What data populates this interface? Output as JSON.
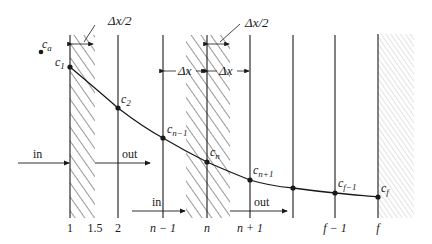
{
  "figure": {
    "colors": {
      "ink": "#1a1a1a",
      "light_hatch": "#b8b8b8"
    },
    "grid_lines": [
      {
        "id": "line-1",
        "label": "1"
      },
      {
        "id": "line-1-5",
        "label": "1.5"
      },
      {
        "id": "line-2",
        "label": "2"
      },
      {
        "id": "line-n-minus-1",
        "label": "n − 1"
      },
      {
        "id": "line-n",
        "label": "n"
      },
      {
        "id": "line-n-plus-1",
        "label": "n + 1"
      },
      {
        "id": "line-unlabeled",
        "label": ""
      },
      {
        "id": "line-f-minus-1",
        "label": "f − 1"
      },
      {
        "id": "line-f",
        "label": "f"
      }
    ],
    "points": [
      {
        "name": "c_1",
        "base": "c",
        "sub": "1"
      },
      {
        "name": "c_2",
        "base": "c",
        "sub": "2"
      },
      {
        "name": "c_n-1",
        "base": "c",
        "sub": "n−1"
      },
      {
        "name": "c_n",
        "base": "c",
        "sub": "n"
      },
      {
        "name": "c_n+1",
        "base": "c",
        "sub": "n+1"
      },
      {
        "name": "c_unlabeled",
        "base": "",
        "sub": ""
      },
      {
        "name": "c_f-1",
        "base": "c",
        "sub": "f−1"
      },
      {
        "name": "c_f",
        "base": "c",
        "sub": "f"
      }
    ],
    "ambient_point": {
      "base": "c",
      "sub": "a"
    },
    "dimension_labels": {
      "half_dx_left": "Δx/2",
      "half_dx_center": "Δx/2",
      "dx_left": "Δx",
      "dx_right": "Δx"
    },
    "flux_labels": {
      "in_left": "in",
      "out_left": "out",
      "in_center": "in",
      "out_center": "out"
    }
  }
}
